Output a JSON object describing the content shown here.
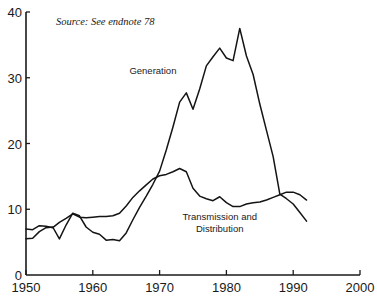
{
  "chart_data": {
    "type": "line",
    "title": "",
    "subtitle": "",
    "xlabel": "",
    "ylabel": "",
    "xlim": [
      1950,
      2000
    ],
    "ylim": [
      0,
      40
    ],
    "xticks": [
      1950,
      1960,
      1970,
      1980,
      1990,
      2000
    ],
    "yticks": [
      0,
      10,
      20,
      30,
      40
    ],
    "xtick_labels": [
      "1950",
      "1960",
      "1970",
      "1980",
      "1990",
      "2000"
    ],
    "ytick_labels": [
      "0",
      "10",
      "20",
      "30",
      "40"
    ],
    "grid": false,
    "legend_position": "inline-annotation",
    "series": [
      {
        "name": "Generation",
        "label": "Generation",
        "color": "#141414",
        "x": [
          1950,
          1951,
          1952,
          1953,
          1954,
          1955,
          1956,
          1957,
          1958,
          1959,
          1960,
          1961,
          1962,
          1963,
          1964,
          1965,
          1966,
          1967,
          1968,
          1969,
          1970,
          1971,
          1972,
          1973,
          1974,
          1975,
          1976,
          1977,
          1978,
          1979,
          1980,
          1981,
          1982,
          1983,
          1984,
          1985,
          1986,
          1987,
          1988,
          1989,
          1990,
          1991,
          1992
        ],
        "y": [
          5.5,
          5.6,
          6.6,
          7.2,
          7.3,
          5.5,
          7.6,
          9.4,
          9.0,
          7.3,
          6.5,
          6.2,
          5.3,
          5.4,
          5.2,
          6.4,
          8.4,
          10.3,
          12.0,
          13.8,
          15.8,
          19.0,
          22.5,
          26.3,
          27.7,
          25.2,
          28.3,
          31.8,
          33.2,
          34.5,
          33.0,
          32.6,
          37.5,
          33.3,
          30.5,
          26.0,
          22.0,
          18.0,
          12.3,
          11.6,
          10.8,
          9.5,
          8.2
        ]
      },
      {
        "name": "Transmission and Distribution",
        "label": "Transmission and\nDistribution",
        "color": "#141414",
        "x": [
          1950,
          1951,
          1952,
          1953,
          1954,
          1955,
          1956,
          1957,
          1958,
          1959,
          1960,
          1961,
          1962,
          1963,
          1964,
          1965,
          1966,
          1967,
          1968,
          1969,
          1970,
          1971,
          1972,
          1973,
          1974,
          1975,
          1976,
          1977,
          1978,
          1979,
          1980,
          1981,
          1982,
          1983,
          1984,
          1985,
          1986,
          1987,
          1988,
          1989,
          1990,
          1991,
          1992
        ],
        "y": [
          7.0,
          6.9,
          7.5,
          7.4,
          7.2,
          8.0,
          8.6,
          9.3,
          8.8,
          8.7,
          8.8,
          8.9,
          8.9,
          9.0,
          9.4,
          10.5,
          11.8,
          12.8,
          13.7,
          14.6,
          15.1,
          15.3,
          15.7,
          16.2,
          15.7,
          13.2,
          12.0,
          11.6,
          11.3,
          11.9,
          11.0,
          10.4,
          10.4,
          10.8,
          11.0,
          11.1,
          11.4,
          11.8,
          12.2,
          12.6,
          12.6,
          12.2,
          11.4
        ]
      }
    ],
    "annotations": [
      {
        "name": "source-note",
        "text": "Source: See endnote 78",
        "x": 1954.5,
        "y": 38.0
      },
      {
        "name": "generation-label",
        "text": "Generation",
        "x": 1969.0,
        "y": 30.5
      },
      {
        "name": "transmission-label-line1",
        "text": "Transmission  and",
        "x": 1979.0,
        "y": 8.3
      },
      {
        "name": "transmission-label-line2",
        "text": "Distribution",
        "x": 1979.0,
        "y": 6.6
      }
    ],
    "axes": {
      "left_spine": true,
      "bottom_spine": true,
      "top_spine": false,
      "right_spine": false
    }
  }
}
